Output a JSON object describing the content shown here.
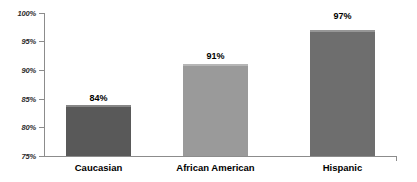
{
  "chart_data": {
    "type": "bar",
    "title": "",
    "subtitle": "",
    "xlabel": "",
    "ylabel": "",
    "categories": [
      "Caucasian",
      "African American",
      "Hispanic"
    ],
    "values": [
      84,
      91,
      97
    ],
    "data_labels": [
      "84%",
      "91%",
      "97%"
    ],
    "ylim": [
      75,
      100
    ],
    "ytick_values": [
      100,
      95,
      90,
      85,
      80,
      75
    ],
    "ytick_labels": [
      "100%",
      "95%",
      "90%",
      "85%",
      "80%",
      "75%"
    ],
    "grid": false,
    "legend": false,
    "legend_position": "none",
    "annotations": [],
    "bar_colors": [
      "#595959",
      "#9a9a9a",
      "#6e6e6e"
    ],
    "axis_color": "#8c8c8c",
    "background_color": "#ffffff",
    "label_color": "#000000"
  },
  "axis": {
    "y_labels": {
      "t100": "100%",
      "t95": "95%",
      "t90": "90%",
      "t85": "85%",
      "t80": "80%",
      "t75": "75%"
    }
  },
  "bars": {
    "b1": {
      "category": "Caucasian",
      "value_label": "84%"
    },
    "b2": {
      "category": "African American",
      "value_label": "91%"
    },
    "b3": {
      "category": "Hispanic",
      "value_label": "97%"
    }
  }
}
